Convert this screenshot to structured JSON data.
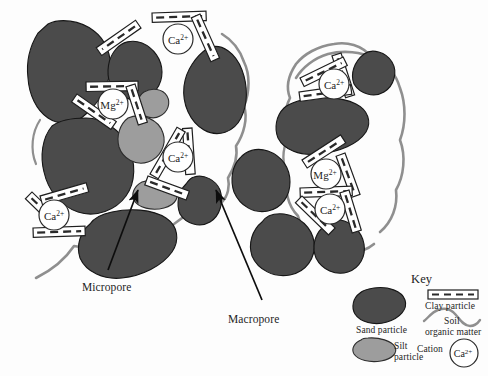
{
  "figure": {
    "type": "soil-aggregate-structure-diagram",
    "background_color": "#fdfdfd"
  },
  "colors": {
    "sand_particle": "#4b4b4b",
    "silt_particle": "#9d9d9d",
    "clay_particle_fill": "#ffffff",
    "clay_particle_stroke": "#1f1f1f",
    "clay_particle_dash": "#2a2a2a",
    "organic_matter": "#8f8f8f",
    "cation_circle_stroke": "#2a2a2a",
    "cation_circle_fill": "#ffffff",
    "outline": "#161616",
    "arrow": "#0d0d0d",
    "text": "#1d1d1d"
  },
  "annotations": {
    "micropore": {
      "label": "Micropore",
      "x": 82,
      "y": 281
    },
    "macropore": {
      "label": "Macropore",
      "x": 228,
      "y": 313
    }
  },
  "cations": {
    "left_aggregate": [
      {
        "label": "Ca",
        "charge": "2+",
        "cx": 178,
        "cy": 39
      },
      {
        "label": "Mg",
        "charge": "2+",
        "cx": 113,
        "cy": 104
      },
      {
        "label": "Ca",
        "charge": "2+",
        "cx": 178,
        "cy": 157
      },
      {
        "label": "Ca",
        "charge": "2+",
        "cx": 54,
        "cy": 215
      }
    ],
    "right_aggregate": [
      {
        "label": "Ca",
        "charge": "2+",
        "cx": 334,
        "cy": 84
      },
      {
        "label": "Mg",
        "charge": "2+",
        "cx": 326,
        "cy": 174
      },
      {
        "label": "Ca",
        "charge": "2+",
        "cx": 330,
        "cy": 207
      }
    ]
  },
  "key": {
    "title": "Key",
    "entries": [
      {
        "name": "sand-particle",
        "label": "Sand particle"
      },
      {
        "name": "silt-particle",
        "label": "Silt\nparticle",
        "line1": "Silt",
        "line2": "particle"
      },
      {
        "name": "clay-particle",
        "label": "Clay particle"
      },
      {
        "name": "soil-organic-matter",
        "label": "Soil\norganic matter",
        "line1": "Soil",
        "line2": "organic matter"
      },
      {
        "name": "cation",
        "label": "Cation",
        "symbol": "Ca",
        "symbol_charge": "2+"
      }
    ]
  }
}
